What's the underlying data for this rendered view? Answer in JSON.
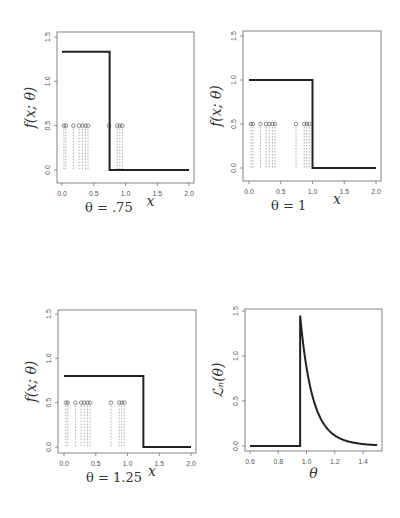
{
  "chart_data": [
    {
      "type": "line",
      "panel": "top-left",
      "caption": "θ = .75",
      "xlabel": "x",
      "ylabel": "f(x; θ)",
      "xlim": [
        0,
        2
      ],
      "ylim": [
        0,
        1.5
      ],
      "xticks": [
        "0.0",
        "0.5",
        "1.0",
        "1.5",
        "2.0"
      ],
      "yticks": [
        "0.0",
        "0.5",
        "1.0",
        "1.5"
      ],
      "theta": 0.75,
      "density_height": 1.333,
      "sample_points_y": 0.5,
      "sample_points_x": [
        0.03,
        0.06,
        0.18,
        0.27,
        0.32,
        0.37,
        0.41,
        0.74,
        0.87,
        0.91,
        0.95
      ],
      "box": {
        "left": 57,
        "top": 32,
        "right": 194,
        "bottom": 183,
        "x0px": 62,
        "x1px": 189,
        "y0px": 170,
        "y1px": 37
      }
    },
    {
      "type": "line",
      "panel": "top-right",
      "caption": "θ = 1",
      "xlabel": "x",
      "ylabel": "f(x; θ)",
      "xlim": [
        0,
        2
      ],
      "ylim": [
        0,
        1.5
      ],
      "xticks": [
        "0.0",
        "0.5",
        "1.0",
        "1.5",
        "2.0"
      ],
      "yticks": [
        "0.0",
        "0.5",
        "1.0",
        "1.5"
      ],
      "theta": 1.0,
      "density_height": 1.0,
      "sample_points_y": 0.5,
      "sample_points_x": [
        0.03,
        0.06,
        0.18,
        0.27,
        0.32,
        0.37,
        0.41,
        0.74,
        0.87,
        0.91,
        0.95
      ],
      "box": {
        "left": 243,
        "top": 31,
        "right": 381,
        "bottom": 181,
        "x0px": 249,
        "x1px": 376,
        "y0px": 168,
        "y1px": 36
      }
    },
    {
      "type": "line",
      "panel": "bottom-left",
      "caption": "θ = 1.25",
      "xlabel": "x",
      "ylabel": "f(x; θ)",
      "xlim": [
        0,
        2
      ],
      "ylim": [
        0,
        1.5
      ],
      "xticks": [
        "0.0",
        "0.5",
        "1.0",
        "1.5",
        "2.0"
      ],
      "yticks": [
        "0.0",
        "0.5",
        "1.0",
        "1.5"
      ],
      "theta": 1.25,
      "density_height": 0.8,
      "sample_points_y": 0.5,
      "sample_points_x": [
        0.03,
        0.06,
        0.18,
        0.27,
        0.32,
        0.37,
        0.41,
        0.74,
        0.87,
        0.91,
        0.95
      ],
      "box": {
        "left": 58,
        "top": 310,
        "right": 196,
        "bottom": 453,
        "x0px": 64,
        "x1px": 191,
        "y0px": 447,
        "y1px": 314
      }
    },
    {
      "type": "line",
      "panel": "bottom-right",
      "caption": "",
      "xlabel": "θ",
      "ylabel": "L_n(θ)",
      "xlim": [
        0.6,
        1.5
      ],
      "ylim": [
        0,
        1.5
      ],
      "xticks": [
        "0.6",
        "0.8",
        "1.0",
        "1.2",
        "1.4"
      ],
      "xtick_values": [
        0.6,
        0.8,
        1.0,
        1.2,
        1.4
      ],
      "yticks": [
        "0.0",
        "0.5",
        "1.0",
        "1.5"
      ],
      "theta_hat": 0.955,
      "peak_value": 1.45,
      "n": 11,
      "box": {
        "left": 245,
        "top": 309,
        "right": 382,
        "bottom": 451,
        "x0px": 250,
        "x1px": 363,
        "y0px": 446,
        "y1px": 311
      }
    }
  ]
}
